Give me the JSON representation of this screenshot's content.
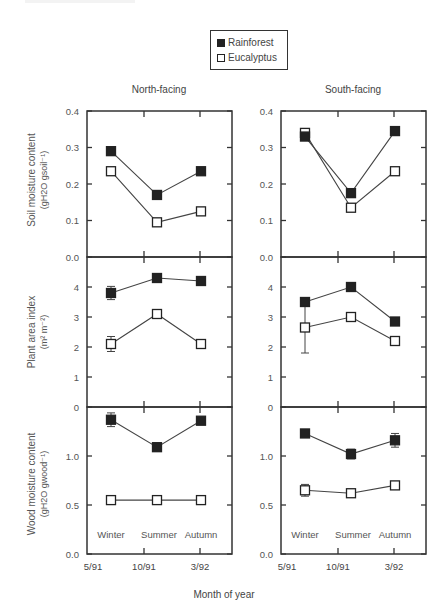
{
  "legend": {
    "items": [
      {
        "label": "Rainforest",
        "marker": "filled-square"
      },
      {
        "label": "Eucalyptus",
        "marker": "open-square"
      }
    ]
  },
  "columns": [
    {
      "title": "North-facing"
    },
    {
      "title": "South-facing"
    }
  ],
  "rows": [
    {
      "ylabel_line1": "Soil moisture content",
      "ylabel_line2": "(gH2O gsoil⁻¹)"
    },
    {
      "ylabel_line1": "Plant area index",
      "ylabel_line2": "(m² m⁻²)"
    },
    {
      "ylabel_line1": "Wood moisture content",
      "ylabel_line2": "(gH2O gwood⁻¹)"
    }
  ],
  "xaxis": {
    "label": "Month of year",
    "ticks": [
      "5/91",
      "10/91",
      "3/92"
    ],
    "season_labels": [
      "Winter",
      "Summer",
      "Autumn"
    ]
  },
  "chart_data": [
    {
      "type": "line",
      "panel": "North-facing / Soil moisture",
      "title": "North-facing",
      "xlabel": "Month of year",
      "ylabel": "Soil moisture content (gH2O gsoil-1)",
      "categories": [
        "Winter",
        "Summer",
        "Autumn"
      ],
      "ylim": [
        0.0,
        0.4
      ],
      "yticks": [
        0.0,
        0.1,
        0.2,
        0.3,
        0.4
      ],
      "series": [
        {
          "name": "Rainforest",
          "values": [
            0.29,
            0.17,
            0.235
          ],
          "err": [
            0,
            0,
            0
          ]
        },
        {
          "name": "Eucalyptus",
          "values": [
            0.235,
            0.095,
            0.125
          ],
          "err": [
            0,
            0,
            0
          ]
        }
      ]
    },
    {
      "type": "line",
      "panel": "South-facing / Soil moisture",
      "title": "South-facing",
      "xlabel": "Month of year",
      "ylabel": "Soil moisture content (gH2O gsoil-1)",
      "categories": [
        "Winter",
        "Summer",
        "Autumn"
      ],
      "ylim": [
        0.0,
        0.4
      ],
      "yticks": [
        0.0,
        0.1,
        0.2,
        0.3,
        0.4
      ],
      "series": [
        {
          "name": "Rainforest",
          "values": [
            0.33,
            0.175,
            0.345
          ],
          "err": [
            0,
            0,
            0
          ]
        },
        {
          "name": "Eucalyptus",
          "values": [
            0.34,
            0.135,
            0.235
          ],
          "err": [
            0,
            0,
            0
          ]
        }
      ]
    },
    {
      "type": "line",
      "panel": "North-facing / Plant area index",
      "ylabel": "Plant area index (m2 m-2)",
      "categories": [
        "Winter",
        "Summer",
        "Autumn"
      ],
      "ylim": [
        0,
        5
      ],
      "yticks": [
        0,
        1,
        2,
        3,
        4
      ],
      "series": [
        {
          "name": "Rainforest",
          "values": [
            3.8,
            4.3,
            4.2
          ],
          "err": [
            0.22,
            0,
            0
          ]
        },
        {
          "name": "Eucalyptus",
          "values": [
            2.1,
            3.1,
            2.1
          ],
          "err": [
            0.25,
            0.12,
            0
          ]
        }
      ]
    },
    {
      "type": "line",
      "panel": "South-facing / Plant area index",
      "ylabel": "Plant area index (m2 m-2)",
      "categories": [
        "Winter",
        "Summer",
        "Autumn"
      ],
      "ylim": [
        0,
        5
      ],
      "yticks": [
        0,
        1,
        2,
        3,
        4
      ],
      "series": [
        {
          "name": "Rainforest",
          "values": [
            3.5,
            4.0,
            2.85
          ],
          "err": [
            0,
            0,
            0
          ]
        },
        {
          "name": "Eucalyptus",
          "values": [
            2.65,
            3.0,
            2.2
          ],
          "err": [
            0.85,
            0,
            0.1
          ]
        }
      ]
    },
    {
      "type": "line",
      "panel": "North-facing / Wood moisture",
      "ylabel": "Wood moisture content (gH2O gwood-1)",
      "xlabel": "Month of year",
      "categories": [
        "Winter",
        "Summer",
        "Autumn"
      ],
      "x_ticks": [
        "5/91",
        "10/91",
        "3/92"
      ],
      "ylim": [
        0.0,
        1.5
      ],
      "yticks": [
        0.0,
        0.5,
        1.0
      ],
      "series": [
        {
          "name": "Rainforest",
          "values": [
            1.37,
            1.09,
            1.36
          ],
          "err": [
            0.07,
            0,
            0
          ]
        },
        {
          "name": "Eucalyptus",
          "values": [
            0.55,
            0.55,
            0.55
          ],
          "err": [
            0,
            0,
            0
          ]
        }
      ]
    },
    {
      "type": "line",
      "panel": "South-facing / Wood moisture",
      "ylabel": "Wood moisture content (gH2O gwood-1)",
      "xlabel": "Month of year",
      "categories": [
        "Winter",
        "Summer",
        "Autumn"
      ],
      "x_ticks": [
        "5/91",
        "10/91",
        "3/92"
      ],
      "ylim": [
        0.0,
        1.5
      ],
      "yticks": [
        0.0,
        0.5,
        1.0
      ],
      "series": [
        {
          "name": "Rainforest",
          "values": [
            1.23,
            1.02,
            1.16
          ],
          "err": [
            0,
            0.05,
            0.07
          ]
        },
        {
          "name": "Eucalyptus",
          "values": [
            0.65,
            0.62,
            0.7
          ],
          "err": [
            0.06,
            0,
            0
          ]
        }
      ]
    }
  ],
  "colors": {
    "axis": "#333333",
    "filled": "#222222",
    "open_fill": "#ffffff",
    "line": "#444444",
    "text": "#444444"
  }
}
